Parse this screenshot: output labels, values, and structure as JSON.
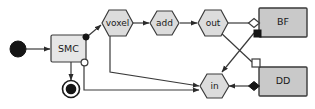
{
  "diagram": {
    "type": "activity-dataflow-diagram",
    "background_color": "#ffffff",
    "stroke_color": "#3a3a3a",
    "nodes": {
      "initial": {
        "name": "initial-node",
        "shape": "filled-circle"
      },
      "final": {
        "name": "final-node",
        "shape": "circle-with-ring"
      },
      "smc": {
        "label": "SMC",
        "shape": "rounded-rect",
        "fill": "#e6e6e6"
      },
      "voxel": {
        "label": "voxel",
        "shape": "hexagon",
        "fill": "#dcdcdc"
      },
      "add": {
        "label": "add",
        "shape": "hexagon",
        "fill": "#dcdcdc"
      },
      "out": {
        "label": "out",
        "shape": "hexagon",
        "fill": "#dcdcdc"
      },
      "in": {
        "label": "in",
        "shape": "hexagon",
        "fill": "#dcdcdc"
      },
      "bf": {
        "label": "BF",
        "shape": "rect",
        "fill": "#c9c9c9"
      },
      "dd": {
        "label": "DD",
        "shape": "rect",
        "fill": "#c9c9c9"
      }
    },
    "ports": {
      "smc_top_right": {
        "name": "filled-dot-port",
        "style": "filled-circle"
      },
      "smc_bottom_right": {
        "name": "open-circle-port",
        "style": "open-circle"
      },
      "bf_left": {
        "name": "open-diamond-port",
        "style": "open-diamond"
      },
      "bf_bottom_left": {
        "name": "filled-square-port",
        "style": "filled-square"
      },
      "dd_top_left": {
        "name": "open-square-port",
        "style": "open-square"
      },
      "dd_left": {
        "name": "filled-diamond-port",
        "style": "filled-diamond"
      }
    },
    "edges": [
      {
        "from": "initial",
        "to": "smc",
        "arrow": true
      },
      {
        "from": "smc",
        "to": "final",
        "arrow": true
      },
      {
        "from": "smc_top_right",
        "to": "voxel",
        "arrow": true
      },
      {
        "from": "voxel",
        "to": "add",
        "arrow": true
      },
      {
        "from": "add",
        "to": "out",
        "arrow": true
      },
      {
        "from": "out",
        "to": "bf_left",
        "arrow": false
      },
      {
        "from": "out",
        "to": "dd_top_left",
        "arrow": false
      },
      {
        "from": "bf_bottom_left",
        "to": "in",
        "arrow": true
      },
      {
        "from": "dd_left",
        "to": "in",
        "arrow": true
      },
      {
        "from": "voxel",
        "to": "in",
        "arrow": true
      },
      {
        "from": "smc_bottom_right",
        "to": "in",
        "arrow": true
      }
    ]
  }
}
